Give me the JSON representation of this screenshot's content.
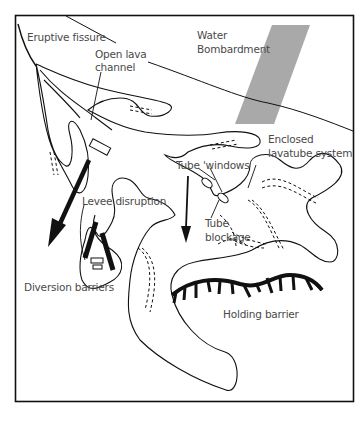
{
  "diagram": {
    "colors": {
      "frame": "#111111",
      "outline": "#111111",
      "water_band": "#a9a9a9",
      "label": "#4a4a4a"
    },
    "labels": {
      "eruptive_fissure": "Eruptive fissure",
      "open_lava_channel_line1": "Open lava",
      "open_lava_channel_line2": "channel",
      "water_line1": "Water",
      "water_line2": "Bombardment",
      "enclosed_line1": "Enclosed",
      "enclosed_line2": "lavatube system",
      "tube_windows": "Tube 'windows",
      "tube_blockage_line1": "Tube",
      "tube_blockage_line2": "blockage",
      "levee_disruption": "Levee disruption",
      "diversion_barriers": "Diversion barriers",
      "holding_barrier": "Holding barrier"
    }
  }
}
